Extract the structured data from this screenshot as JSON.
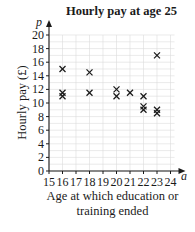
{
  "chart_data": {
    "type": "scatter",
    "title": "Hourly pay at age 25",
    "xlabel": "Age at which education or training ended",
    "xlabel_lines": [
      "Age at which education or",
      "training ended"
    ],
    "ylabel": "Hourly pay (£)",
    "x_axis_symbol": "a",
    "y_axis_symbol": "p",
    "xlim": [
      15,
      24
    ],
    "ylim": [
      0,
      20
    ],
    "x_ticks": [
      15,
      16,
      17,
      18,
      19,
      20,
      21,
      22,
      23,
      24
    ],
    "y_ticks": [
      0,
      2,
      4,
      6,
      8,
      10,
      12,
      14,
      16,
      18,
      20
    ],
    "grid": true,
    "marker": "x",
    "points": [
      {
        "x": 16,
        "y": 15
      },
      {
        "x": 16,
        "y": 11.5
      },
      {
        "x": 16,
        "y": 11
      },
      {
        "x": 18,
        "y": 14.5
      },
      {
        "x": 18,
        "y": 11.5
      },
      {
        "x": 20,
        "y": 12
      },
      {
        "x": 20,
        "y": 11
      },
      {
        "x": 21,
        "y": 11.5
      },
      {
        "x": 22,
        "y": 11
      },
      {
        "x": 22,
        "y": 9.5
      },
      {
        "x": 22,
        "y": 9
      },
      {
        "x": 23,
        "y": 17
      },
      {
        "x": 23,
        "y": 9
      },
      {
        "x": 23,
        "y": 8.5
      }
    ]
  }
}
